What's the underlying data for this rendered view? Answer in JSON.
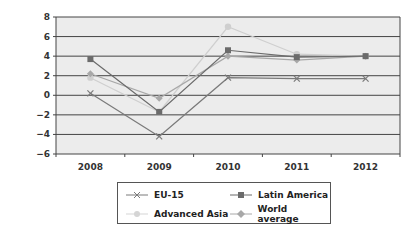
{
  "chart_data": {
    "type": "line",
    "title": "",
    "xlabel": "",
    "ylabel": "",
    "categories": [
      "2008",
      "2009",
      "2010",
      "2011",
      "2012"
    ],
    "ylim": [
      -6,
      8
    ],
    "yticks": [
      8,
      6,
      4,
      2,
      0,
      -2,
      -4,
      -6
    ],
    "ytick_labels": [
      "8",
      "6",
      "4",
      "2",
      "0",
      "−2",
      "−4",
      "−6"
    ],
    "grid": true,
    "legend_position": "bottom",
    "series": [
      {
        "name": "EU-15",
        "values": [
          0.2,
          -4.2,
          1.8,
          1.7,
          1.7
        ],
        "color": "#7a7a7a",
        "marker": "x"
      },
      {
        "name": "Latin America",
        "values": [
          3.7,
          -1.7,
          4.6,
          3.9,
          4.0
        ],
        "color": "#6b6b6b",
        "marker": "square"
      },
      {
        "name": "Advanced Asia",
        "values": [
          1.8,
          -1.7,
          7.0,
          4.2,
          4.0
        ],
        "color": "#cfcfcf",
        "marker": "circle"
      },
      {
        "name": "World average",
        "values": [
          2.2,
          -0.3,
          4.0,
          3.6,
          4.0
        ],
        "color": "#a8a8a8",
        "marker": "diamond"
      }
    ]
  },
  "legend": {
    "items": [
      {
        "label": "EU-15"
      },
      {
        "label": "Latin America"
      },
      {
        "label": "Advanced Asia"
      },
      {
        "label": "World average"
      }
    ]
  }
}
